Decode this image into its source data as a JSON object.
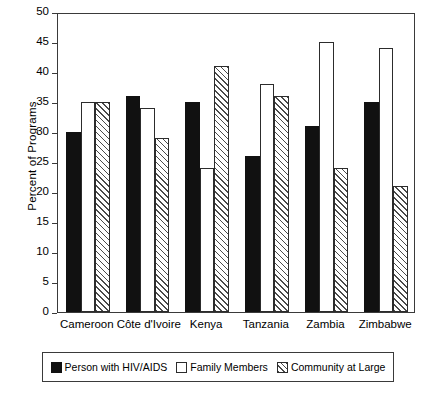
{
  "chart_data": {
    "type": "bar",
    "title": "",
    "xlabel": "",
    "ylabel": "Percent of Programs",
    "ylim": [
      0,
      50
    ],
    "ytick_step": 5,
    "yticks": [
      0,
      5,
      10,
      15,
      20,
      25,
      30,
      35,
      40,
      45,
      50
    ],
    "grid": false,
    "legend_position": "bottom",
    "categories": [
      "Cameroon",
      "Côte d'Ivoire",
      "Kenya",
      "Tanzania",
      "Zambia",
      "Zimbabwe"
    ],
    "series": [
      {
        "name": "Person with HIV/AIDS",
        "style": "solid-black",
        "color": "#111111",
        "values": [
          30,
          36,
          35,
          26,
          31,
          35
        ]
      },
      {
        "name": "Family Members",
        "style": "open-white",
        "color": "#ffffff",
        "values": [
          35,
          34,
          24,
          38,
          45,
          44
        ]
      },
      {
        "name": "Community at Large",
        "style": "diagonal-hatch",
        "color": "#ffffff",
        "values": [
          35,
          29,
          41,
          36,
          24,
          21
        ]
      }
    ]
  },
  "legend": {
    "items": [
      {
        "label": "Person with HIV/AIDS"
      },
      {
        "label": "Family Members"
      },
      {
        "label": "Community at Large"
      }
    ]
  }
}
